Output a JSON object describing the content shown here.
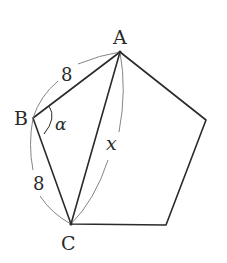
{
  "figure": {
    "shape": "regular pentagon with triangle ABC",
    "vertices": {
      "A": {
        "label": "A"
      },
      "B": {
        "label": "B"
      },
      "C": {
        "label": "C"
      }
    },
    "measurements": {
      "AB": "8",
      "BC": "8",
      "AC": "x",
      "angle_B": "α"
    }
  },
  "colors": {
    "line": "#2a2a2a",
    "dimension_arc": "#777777",
    "background": "#ffffff"
  }
}
